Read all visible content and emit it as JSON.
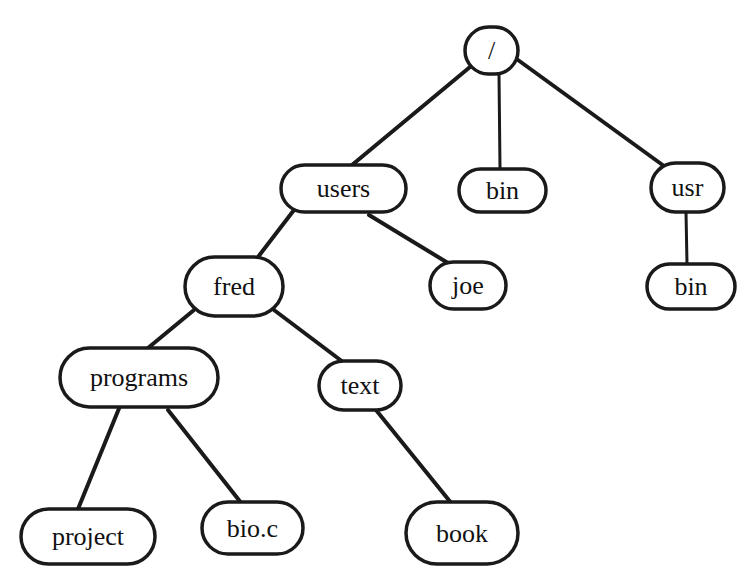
{
  "diagram": {
    "type": "directory-tree",
    "colors": {
      "stroke": "#1a1a1a",
      "fill": "#ffffff",
      "text": "#111111"
    },
    "nodes": [
      {
        "id": "root",
        "label": "/",
        "x": 465,
        "y": 27,
        "w": 53,
        "h": 47
      },
      {
        "id": "users",
        "label": "users",
        "x": 281,
        "y": 165,
        "w": 125,
        "h": 47
      },
      {
        "id": "bin",
        "label": "bin",
        "x": 459,
        "y": 169,
        "w": 87,
        "h": 43
      },
      {
        "id": "usr",
        "label": "usr",
        "x": 651,
        "y": 163,
        "w": 73,
        "h": 49
      },
      {
        "id": "fred",
        "label": "fred",
        "x": 185,
        "y": 257,
        "w": 98,
        "h": 59
      },
      {
        "id": "joe",
        "label": "joe",
        "x": 430,
        "y": 262,
        "w": 76,
        "h": 47
      },
      {
        "id": "usr_bin",
        "label": "bin",
        "x": 647,
        "y": 264,
        "w": 88,
        "h": 45
      },
      {
        "id": "programs",
        "label": "programs",
        "x": 60,
        "y": 348,
        "w": 158,
        "h": 59
      },
      {
        "id": "text",
        "label": "text",
        "x": 319,
        "y": 361,
        "w": 82,
        "h": 49
      },
      {
        "id": "project",
        "label": "project",
        "x": 21,
        "y": 509,
        "w": 134,
        "h": 55
      },
      {
        "id": "bio_c",
        "label": "bio.c",
        "x": 202,
        "y": 502,
        "w": 101,
        "h": 52
      },
      {
        "id": "book",
        "label": "book",
        "x": 406,
        "y": 502,
        "w": 112,
        "h": 62
      }
    ],
    "edges": [
      {
        "from": "root",
        "to": "users",
        "x1": 470,
        "y1": 67,
        "x2": 352,
        "y2": 165
      },
      {
        "from": "root",
        "to": "bin",
        "x1": 499,
        "y1": 74,
        "x2": 500,
        "y2": 169,
        "thin": true
      },
      {
        "from": "root",
        "to": "usr",
        "x1": 518,
        "y1": 60,
        "x2": 664,
        "y2": 166
      },
      {
        "from": "users",
        "to": "fred",
        "x1": 294,
        "y1": 210,
        "x2": 258,
        "y2": 257
      },
      {
        "from": "users",
        "to": "joe",
        "x1": 369,
        "y1": 215,
        "x2": 448,
        "y2": 263
      },
      {
        "from": "usr",
        "to": "usr_bin",
        "x1": 686,
        "y1": 212,
        "x2": 687,
        "y2": 264,
        "thin": true
      },
      {
        "from": "fred",
        "to": "programs",
        "x1": 194,
        "y1": 310,
        "x2": 148,
        "y2": 348
      },
      {
        "from": "fred",
        "to": "text",
        "x1": 274,
        "y1": 310,
        "x2": 343,
        "y2": 362
      },
      {
        "from": "programs",
        "to": "project",
        "x1": 120,
        "y1": 406,
        "x2": 78,
        "y2": 509
      },
      {
        "from": "programs",
        "to": "bio_c",
        "x1": 168,
        "y1": 410,
        "x2": 242,
        "y2": 504
      },
      {
        "from": "text",
        "to": "book",
        "x1": 376,
        "y1": 410,
        "x2": 452,
        "y2": 504
      }
    ]
  }
}
